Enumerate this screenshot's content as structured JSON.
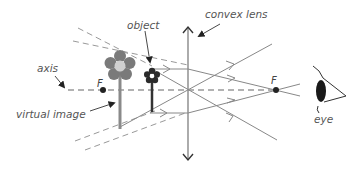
{
  "labels": {
    "object": "object",
    "convex_lens": "convex lens",
    "axis": "axis",
    "virtual_image": "virtual image",
    "eye": "eye",
    "focal_left": "F",
    "focal_right": "F"
  },
  "colors": {
    "ray": "#888888",
    "axis": "#666666",
    "flower_image": "#7a7a7a",
    "flower_center_image": "#cfcfcf",
    "flower_object": "#333333",
    "eye": "#1a1a1a",
    "text": "#555555"
  }
}
